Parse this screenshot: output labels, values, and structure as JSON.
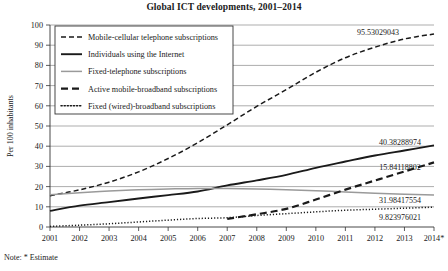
{
  "figure": {
    "title": "Global ICT developments, 2001–2014",
    "note": "Note: * Estimate",
    "y_axis_title": "Per 100 inhabitants",
    "background": "#ffffff",
    "ink_color": "#1a1a1a",
    "grid_color": "#8a8a8a",
    "grey_series_color": "#9a9a9a"
  },
  "chart_data": {
    "type": "line",
    "title": "Global ICT developments, 2001–2014",
    "xlabel": "",
    "ylabel": "Per 100 inhabitants",
    "ylim": [
      0,
      100
    ],
    "ytick_step": 10,
    "yticks": [
      "0",
      "10",
      "20",
      "30",
      "40",
      "50",
      "60",
      "70",
      "80",
      "90",
      "100"
    ],
    "grid": "horizontal",
    "legend_position": "upper-left-inside",
    "categories": [
      "2001",
      "2002",
      "2003",
      "2004",
      "2005",
      "2006",
      "2007",
      "2008",
      "2009",
      "2010",
      "2011",
      "2012",
      "2013",
      "2014*"
    ],
    "x": [
      2001,
      2002,
      2003,
      2004,
      2005,
      2006,
      2007,
      2008,
      2009,
      2010,
      2011,
      2012,
      2013,
      2014
    ],
    "series": [
      {
        "name": "Mobile-cellular telephone subscriptions",
        "style": "dashed",
        "color": "#1a1a1a",
        "width": 1.5,
        "dash": "5,3",
        "end_label": "95.53029043",
        "values": [
          15.5,
          18.4,
          22.2,
          27.3,
          33.9,
          41.7,
          50.6,
          59.7,
          68.0,
          76.6,
          83.8,
          89.0,
          93.1,
          95.53029043
        ]
      },
      {
        "name": "Individuals using the Internet",
        "style": "solid",
        "color": "#1a1a1a",
        "width": 1.9,
        "dash": "",
        "end_label": "40.38288974",
        "values": [
          8.0,
          10.6,
          12.3,
          14.1,
          15.8,
          17.6,
          20.6,
          23.1,
          25.8,
          29.3,
          32.4,
          35.4,
          37.9,
          40.38288974
        ]
      },
      {
        "name": "Fixed-telephone subscriptions",
        "style": "solid",
        "color": "#9a9a9a",
        "width": 1.5,
        "dash": "",
        "end_label": "15.84118802",
        "values": [
          16.0,
          17.0,
          17.8,
          18.4,
          18.8,
          19.1,
          19.0,
          18.8,
          18.5,
          18.0,
          17.3,
          16.7,
          16.2,
          15.84118802
        ]
      },
      {
        "name": "Active mobile-broadband subscriptions",
        "style": "dashed-thick",
        "color": "#1a1a1a",
        "width": 2.2,
        "dash": "7,4",
        "end_label": "31.98417554",
        "values": [
          null,
          null,
          null,
          null,
          null,
          null,
          4.0,
          6.3,
          9.0,
          13.6,
          18.5,
          23.0,
          27.5,
          31.98417554
        ]
      },
      {
        "name": "Fixed (wired)-broadband subscriptions",
        "style": "dotted",
        "color": "#1a1a1a",
        "width": 1.5,
        "dash": "1.2,1.9",
        "end_label": "9.823976021",
        "values": [
          0.3,
          0.9,
          1.6,
          2.5,
          3.4,
          4.2,
          4.6,
          5.7,
          6.6,
          7.5,
          8.3,
          8.8,
          9.3,
          9.823976021
        ]
      }
    ]
  },
  "legend": {
    "items": [
      {
        "label": "Mobile-cellular telephone subscriptions",
        "swatch": "dashed"
      },
      {
        "label": "Individuals using the Internet",
        "swatch": "solid"
      },
      {
        "label": "Fixed-telephone subscriptions",
        "swatch": "solid-grey"
      },
      {
        "label": "Active mobile-broadband subscriptions",
        "swatch": "dashed-thick"
      },
      {
        "label": "Fixed (wired)-broadband subscriptions",
        "swatch": "dotted"
      }
    ]
  }
}
